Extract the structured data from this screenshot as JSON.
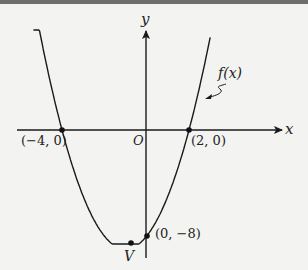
{
  "chart_data": {
    "type": "line",
    "title": "",
    "xlabel": "x",
    "ylabel": "y",
    "function_label": "f(x)",
    "function": "f(x) = (x + 4)(x - 2) = x^2 + 2x - 8",
    "grid": false,
    "legend": "none",
    "origin_label": "O",
    "points": [
      {
        "label": "(-4, 0)",
        "x": -4,
        "y": 0
      },
      {
        "label": "(2, 0)",
        "x": 2,
        "y": 0
      },
      {
        "label": "(0, -8)",
        "x": 0,
        "y": -8
      },
      {
        "label": "V",
        "x": -1,
        "y": -9
      }
    ],
    "x": [
      -5.4,
      -5,
      -4,
      -3,
      -2,
      -1,
      0,
      1,
      2,
      3,
      3.0
    ],
    "values": [
      11.36,
      7,
      0,
      -5,
      -8,
      -9,
      -8,
      -5,
      0,
      7,
      7
    ],
    "xlim": [
      -6.2,
      6.5
    ],
    "ylim": [
      -10,
      7.5
    ]
  },
  "labels": {
    "y_axis": "y",
    "x_axis": "x",
    "origin": "O",
    "fx": "f(x)",
    "p_neg4": "(−4, 0)",
    "p_2": "(2, 0)",
    "p_0neg8": "(0, −8)",
    "vertex": "V"
  }
}
